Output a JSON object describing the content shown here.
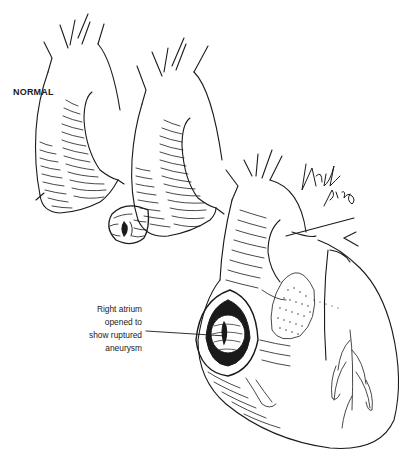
{
  "figure": {
    "panels": [
      {
        "id": "normal",
        "label": "NORMAL",
        "description": "Normal aortic arch with root"
      },
      {
        "id": "aneurysm",
        "label": "",
        "description": "Aortic arch with sinus of Valsalva aneurysm"
      },
      {
        "id": "heart",
        "label": "",
        "description": "Heart with right atrium opened"
      }
    ],
    "labels": {
      "normal": "NORMAL",
      "callout_lines": [
        "Right atrium",
        "opened to",
        "show ruptured",
        "aneurysm"
      ]
    },
    "signature": "Howle Smith",
    "colors": {
      "ink": "#1a1a1a",
      "background": "#ffffff"
    }
  }
}
